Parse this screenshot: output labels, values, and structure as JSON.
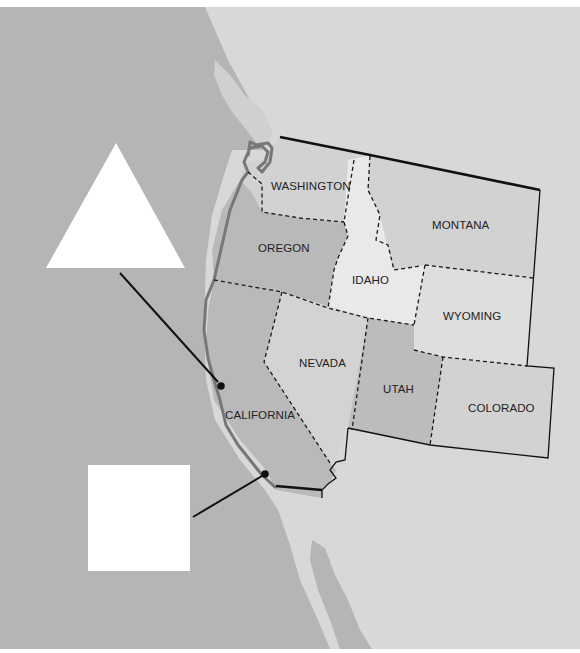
{
  "map": {
    "title": "Western United States",
    "colors": {
      "ocean": "#b5b5b5",
      "land_background": "#d8d8d8",
      "washington": "#d2d2d2",
      "oregon": "#b9b9b9",
      "california": "#b9b9b9",
      "idaho": "#e9e9e9",
      "montana": "#d2d2d2",
      "wyoming": "#dedede",
      "nevada": "#d3d3d3",
      "utah": "#bcbcbc",
      "colorado": "#d2d2d2",
      "coastline": "#777777",
      "border": "#111111"
    },
    "states": [
      {
        "name": "WASHINGTON"
      },
      {
        "name": "OREGON"
      },
      {
        "name": "CALIFORNIA"
      },
      {
        "name": "IDAHO"
      },
      {
        "name": "MONTANA"
      },
      {
        "name": "WYOMING"
      },
      {
        "name": "NEVADA"
      },
      {
        "name": "UTAH"
      },
      {
        "name": "COLORADO"
      }
    ],
    "markers": [
      {
        "shape": "triangle",
        "label": "",
        "location": "northern California coast"
      },
      {
        "shape": "square",
        "label": "",
        "location": "southern California coast"
      }
    ]
  }
}
